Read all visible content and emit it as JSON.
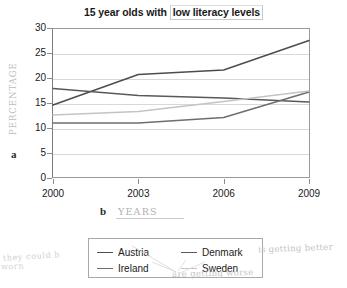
{
  "chart_data": {
    "type": "line",
    "title": "15 year olds with low literacy levels",
    "title_plain": "15 year olds with",
    "title_boxed": "low literacy levels",
    "xlabel": "",
    "ylabel": "",
    "categories": [
      "2000",
      "2003",
      "2006",
      "2009"
    ],
    "x": [
      2000,
      2003,
      2006,
      2009
    ],
    "ylim": [
      0,
      30
    ],
    "yticks": [
      "0",
      "5",
      "10",
      "15",
      "20",
      "25",
      "30"
    ],
    "grid": true,
    "legend_position": "below-center",
    "series": [
      {
        "name": "Austria",
        "values": [
          14.6,
          20.7,
          21.6,
          27.5
        ],
        "color": "#4d4d4d"
      },
      {
        "name": "Denmark",
        "values": [
          17.9,
          16.5,
          16.0,
          15.2
        ],
        "color": "#595959"
      },
      {
        "name": "Ireland",
        "values": [
          11.0,
          11.0,
          12.1,
          17.2
        ],
        "color": "#6e6e6e"
      },
      {
        "name": "Sweden",
        "values": [
          12.6,
          13.3,
          15.3,
          17.4
        ],
        "color": "#c4c4c4"
      }
    ]
  },
  "annotations": {
    "y_axis_hand": "PERCENTAGE",
    "y_axis_marker": "a",
    "x_axis_hand": "YEARS",
    "x_axis_marker": "b",
    "note_right": "is getting better",
    "note_below_legend": "are getting worse",
    "note_bottom_left_1": "they could b",
    "note_bottom_left_2": "worn"
  }
}
